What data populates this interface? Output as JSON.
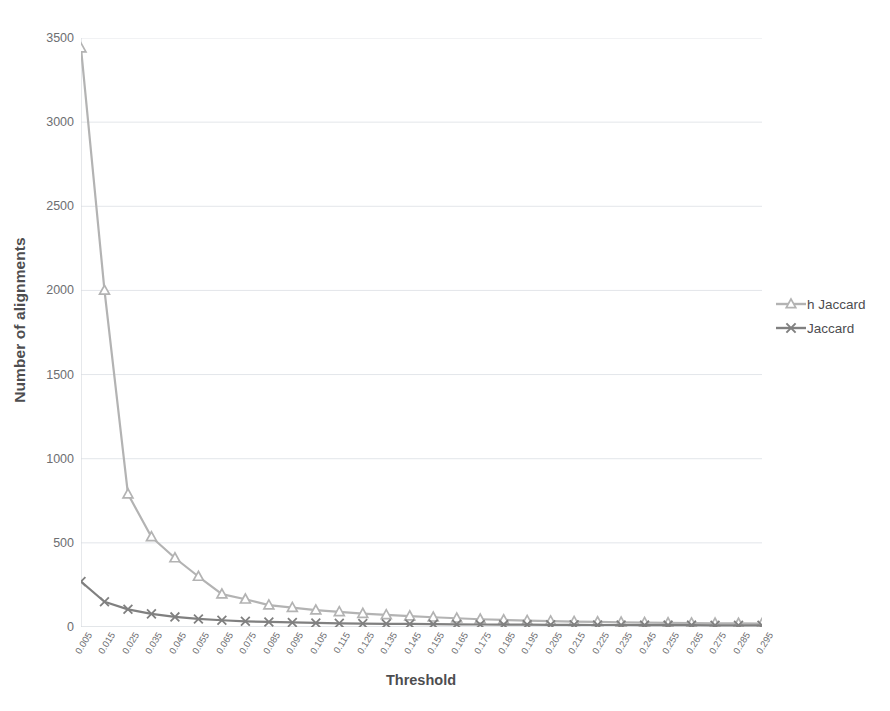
{
  "chart_data": {
    "type": "line",
    "title": "",
    "xlabel": "Threshold",
    "ylabel": "Number of alignments",
    "grid": true,
    "legend_position": "right",
    "xlim": [
      0.005,
      0.295
    ],
    "ylim": [
      0,
      3500
    ],
    "y_ticks": [
      0,
      500,
      1000,
      1500,
      2000,
      2500,
      3000,
      3500
    ],
    "x_ticks": [
      "0.005",
      "0.015",
      "0.025",
      "0.035",
      "0.045",
      "0.055",
      "0.065",
      "0.075",
      "0.085",
      "0.095",
      "0.105",
      "0.115",
      "0.125",
      "0.135",
      "0.145",
      "0.155",
      "0.165",
      "0.175",
      "0.185",
      "0.195",
      "0.205",
      "0.215",
      "0.225",
      "0.235",
      "0.245",
      "0.255",
      "0.265",
      "0.275",
      "0.285",
      "0.295"
    ],
    "x": [
      0.005,
      0.015,
      0.025,
      0.035,
      0.045,
      0.055,
      0.065,
      0.075,
      0.085,
      0.095,
      0.105,
      0.115,
      0.125,
      0.135,
      0.145,
      0.155,
      0.165,
      0.175,
      0.185,
      0.195,
      0.205,
      0.215,
      0.225,
      0.235,
      0.245,
      0.255,
      0.265,
      0.275,
      0.285,
      0.295
    ],
    "series": [
      {
        "name": "h Jaccard",
        "color": "#b3b3b3",
        "marker": "triangle",
        "values": [
          3440,
          2000,
          790,
          535,
          410,
          300,
          195,
          165,
          130,
          115,
          100,
          90,
          80,
          72,
          65,
          58,
          52,
          46,
          42,
          38,
          35,
          32,
          30,
          28,
          26,
          24,
          23,
          22,
          21,
          20
        ]
      },
      {
        "name": "Jaccard",
        "color": "#808080",
        "marker": "x",
        "values": [
          270,
          150,
          105,
          78,
          60,
          48,
          40,
          34,
          30,
          27,
          24,
          22,
          20,
          19,
          18,
          17,
          16,
          15,
          14,
          14,
          13,
          13,
          12,
          12,
          11,
          11,
          11,
          10,
          10,
          10
        ]
      }
    ]
  },
  "legend": {
    "entries": [
      {
        "label": "h Jaccard"
      },
      {
        "label": "Jaccard"
      }
    ]
  },
  "axes": {
    "x_title": "Threshold",
    "y_title": "Number of alignments"
  },
  "colors": {
    "series_light": "#b3b3b3",
    "series_dark": "#808080",
    "grid": "#e3e6ea",
    "axis": "#d6d9dd",
    "text": "#6d6e71",
    "title_text": "#4d4d4f",
    "background": "#ffffff"
  }
}
